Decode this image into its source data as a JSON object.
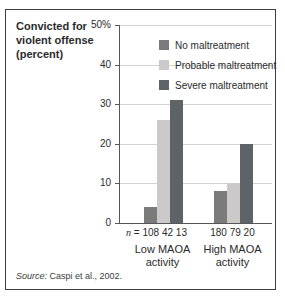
{
  "figure": {
    "title_lines": [
      "Convicted for",
      "violent offense",
      "(percent)"
    ],
    "source_prefix": "Source:",
    "source_rest": " Caspi et al., 2002."
  },
  "chart_data": {
    "type": "bar",
    "title": "Convicted for violent offense (percent)",
    "ylabel": "Convicted for violent offense (percent)",
    "ylim": [
      0,
      50
    ],
    "ytick_step": 10,
    "ytick_labels": [
      "0",
      "10",
      "20",
      "30",
      "40",
      "50%"
    ],
    "grid": true,
    "legend_position": "top-right-inside",
    "categories": [
      "Low MAOA activity",
      "High MAOA activity"
    ],
    "group_labels": [
      [
        "Low MAOA",
        "activity"
      ],
      [
        "High MAOA",
        "activity"
      ]
    ],
    "series": [
      {
        "name": "No maltreatment",
        "color": "#7b7b7b",
        "values": [
          4,
          8
        ]
      },
      {
        "name": "Probable maltreatment",
        "color": "#cbcac8",
        "values": [
          26,
          10
        ]
      },
      {
        "name": "Severe maltreatment",
        "color": "#5d6367",
        "values": [
          31,
          20
        ]
      }
    ],
    "n_prefix_italic": "n",
    "n_prefix_eq": "=",
    "n_values": [
      [
        108,
        42,
        13
      ],
      [
        180,
        79,
        20
      ]
    ],
    "colors": {
      "axis": "#55565a",
      "gridline": "#d2d2d2",
      "border": "#3f3f3f"
    }
  }
}
